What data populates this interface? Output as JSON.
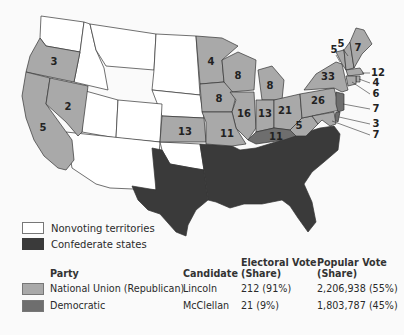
{
  "colors": {
    "national_union": "#a9a9a9",
    "democratic": "#6e6e6e",
    "nonvoting": "#ffffff",
    "confederate": "#3a3a3a"
  },
  "map": {
    "states": [
      {
        "name": "Oregon",
        "party": "national_union",
        "ev": "3"
      },
      {
        "name": "California",
        "party": "national_union",
        "ev": "5"
      },
      {
        "name": "Nevada",
        "party": "national_union",
        "ev": "2"
      },
      {
        "name": "Kansas",
        "party": "national_union",
        "ev": "13"
      },
      {
        "name": "Minnesota",
        "party": "national_union",
        "ev": "4"
      },
      {
        "name": "Wisconsin",
        "party": "national_union",
        "ev": "8"
      },
      {
        "name": "Michigan",
        "party": "national_union",
        "ev": "8"
      },
      {
        "name": "Iowa",
        "party": "national_union",
        "ev": "8"
      },
      {
        "name": "Illinois",
        "party": "national_union",
        "ev": "16"
      },
      {
        "name": "Indiana",
        "party": "national_union",
        "ev": "13"
      },
      {
        "name": "Ohio",
        "party": "national_union",
        "ev": "21"
      },
      {
        "name": "Missouri",
        "party": "national_union",
        "ev": "11"
      },
      {
        "name": "Kentucky",
        "party": "democratic",
        "ev": "11"
      },
      {
        "name": "West Virginia",
        "party": "national_union",
        "ev": "5"
      },
      {
        "name": "Pennsylvania",
        "party": "national_union",
        "ev": "26"
      },
      {
        "name": "New York",
        "party": "national_union",
        "ev": "33"
      },
      {
        "name": "Vermont",
        "party": "national_union",
        "ev": "5"
      },
      {
        "name": "New Hampshire",
        "party": "national_union",
        "ev": "5"
      },
      {
        "name": "Maine",
        "party": "national_union",
        "ev": "7"
      },
      {
        "name": "Massachusetts",
        "party": "national_union",
        "ev": "12"
      },
      {
        "name": "Rhode Island",
        "party": "national_union",
        "ev": "4"
      },
      {
        "name": "Connecticut",
        "party": "national_union",
        "ev": "6"
      },
      {
        "name": "New Jersey",
        "party": "democratic",
        "ev": "7"
      },
      {
        "name": "Delaware",
        "party": "democratic",
        "ev": "3"
      },
      {
        "name": "Maryland",
        "party": "national_union",
        "ev": "7"
      }
    ]
  },
  "legend": {
    "nonvoting": "Nonvoting territories",
    "confederate": "Confederate states"
  },
  "results_table": {
    "headers": {
      "party": "Party",
      "candidate": "Candidate",
      "electoral_line1": "Electoral Vote",
      "electoral_line2": "(Share)",
      "popular_line1": "Popular Vote",
      "popular_line2": "(Share)"
    },
    "rows": [
      {
        "party": "National Union (Republican)",
        "candidate": "Lincoln",
        "electoral": "212 (91%)",
        "popular": "2,206,938 (55%)"
      },
      {
        "party": "Democratic",
        "candidate": "McClellan",
        "electoral": "21 (9%)",
        "popular": "1,803,787 (45%)"
      }
    ]
  }
}
